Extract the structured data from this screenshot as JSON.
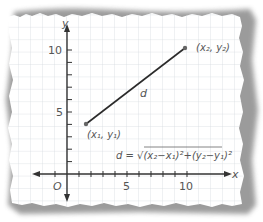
{
  "diagram": {
    "axes": {
      "x_label": "x",
      "y_label": "y",
      "origin_label": "O",
      "x_ticks": [
        {
          "value": 5,
          "label": "5"
        },
        {
          "value": 10,
          "label": "10"
        }
      ],
      "y_ticks": [
        {
          "value": 5,
          "label": "5"
        },
        {
          "value": 10,
          "label": "10"
        }
      ]
    },
    "points": [
      {
        "id": "p1",
        "label": "(x₁, y₁)",
        "x": 1.6,
        "y": 4
      },
      {
        "id": "p2",
        "label": "(x₂, y₂)",
        "x": 10,
        "y": 10
      }
    ],
    "segment_label": "d",
    "formula": {
      "lhs": "d =",
      "text": "d = √(x₂−x₁)²+(y₂−y₁)²"
    },
    "colors": {
      "grid": "#d6dbe0",
      "axis": "#333333",
      "segment": "#2b2b2b",
      "point": "#666666",
      "text": "#555555",
      "shadow": "#6e6e6e"
    }
  }
}
